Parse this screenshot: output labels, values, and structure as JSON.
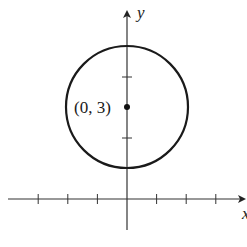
{
  "diagram": {
    "title": "",
    "type": "circle-on-coordinate-plane",
    "axes": {
      "x_label": "x",
      "y_label": "y",
      "x_ticks": [
        -3,
        -2,
        -1,
        1,
        2,
        3
      ],
      "y_ticks": [
        2,
        4
      ],
      "unit_px": 30
    },
    "circle": {
      "center": [
        0,
        3
      ],
      "radius": 2,
      "center_label": "(0, 3)"
    },
    "colors": {
      "stroke": "#1a1a1a",
      "axis": "#333333",
      "background": "#ffffff"
    }
  }
}
